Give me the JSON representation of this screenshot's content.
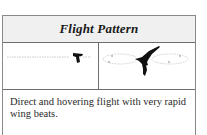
{
  "table": {
    "header": {
      "title": "Flight Pattern"
    },
    "images": [
      {
        "label": "direct-flight",
        "icon": "bird-direct-flight-icon"
      },
      {
        "label": "hovering-flight",
        "icon": "hummingbird-hovering-icon"
      }
    ],
    "description": "Direct and hovering flight with very rapid wing beats."
  },
  "colors": {
    "border": "#6e6e6e",
    "header_bg": "#f0f0f0",
    "text": "#2a2a2a",
    "silhouette": "#111111",
    "path": "#bdbdbd"
  }
}
